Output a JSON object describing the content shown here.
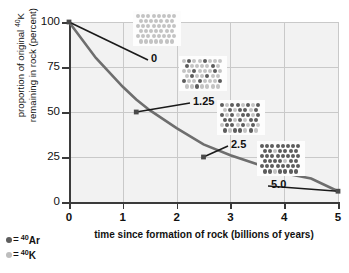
{
  "chart_data": {
    "type": "line",
    "title": "",
    "xlabel": "time since formation of rock (billions of years)",
    "ylabel_line1": "proportion of original ",
    "ylabel_sup1": "40",
    "ylabel_mid": "K",
    "ylabel_line2": "remaining in rock (percent)",
    "ylabel_full": "proportion of original 40K remaining in rock (percent)",
    "xlim": [
      0,
      5
    ],
    "ylim": [
      0,
      100
    ],
    "xticks": [
      "0",
      "1",
      "2",
      "3",
      "4",
      "5"
    ],
    "yticks": [
      "0",
      "25",
      "50",
      "75",
      "100"
    ],
    "grid": true,
    "legend_position": "bottom-left",
    "series": [
      {
        "name": "40K remaining",
        "x": [
          0,
          0.5,
          1.0,
          1.25,
          1.5,
          2.0,
          2.5,
          3.0,
          3.5,
          4.0,
          4.5,
          5.0
        ],
        "values": [
          100,
          80,
          64,
          57,
          51,
          41,
          32,
          26,
          21,
          16,
          13,
          6
        ]
      }
    ],
    "markers": [
      {
        "x": 0,
        "y": 100,
        "label": "0"
      },
      {
        "x": 1.25,
        "y": 50,
        "label": "1.25"
      },
      {
        "x": 2.5,
        "y": 25,
        "label": "2.5"
      },
      {
        "x": 5.0,
        "y": 6,
        "label": "5.0"
      }
    ]
  },
  "legend": {
    "items": [
      {
        "symbol_color": "#5d5d5d",
        "equals": "=",
        "sup": "40",
        "element": "Ar",
        "label": "40Ar"
      },
      {
        "symbol_color": "#bdbdbd",
        "equals": "=",
        "sup": "40",
        "element": "K",
        "label": "40K"
      }
    ]
  },
  "atom_grids": [
    {
      "caption": "0",
      "time": 0,
      "percent_k_remaining": 100,
      "total_atoms": 48,
      "ar_count": 0,
      "k_count": 48,
      "rows": [
        [
          "k",
          "k",
          "k",
          "k",
          "k",
          "k",
          "k",
          "k"
        ],
        [
          "k",
          "k",
          "k",
          "k",
          "k",
          "k",
          "k"
        ],
        [
          "k",
          "k",
          "k",
          "k",
          "k",
          "k",
          "k",
          "k"
        ],
        [
          "k",
          "k",
          "k",
          "k",
          "k",
          "k",
          "k"
        ],
        [
          "k",
          "k",
          "k",
          "k",
          "k",
          "k",
          "k",
          "k"
        ],
        [
          "k",
          "k",
          "k",
          "k",
          "k",
          "k",
          "k"
        ]
      ]
    },
    {
      "caption": "1.25",
      "time": 1.25,
      "percent_k_remaining": 75,
      "total_atoms": 48,
      "ar_count": 12,
      "k_count": 36,
      "rows": [
        [
          "k",
          "ar",
          "k",
          "k",
          "ar",
          "k",
          "k",
          "k"
        ],
        [
          "ar",
          "k",
          "k",
          "k",
          "k",
          "ar",
          "k"
        ],
        [
          "k",
          "k",
          "ar",
          "k",
          "k",
          "k",
          "ar",
          "k"
        ],
        [
          "k",
          "ar",
          "k",
          "k",
          "ar",
          "k",
          "k"
        ],
        [
          "ar",
          "k",
          "k",
          "ar",
          "k",
          "k",
          "k",
          "ar"
        ],
        [
          "k",
          "k",
          "ar",
          "k",
          "k",
          "k",
          "k"
        ]
      ]
    },
    {
      "caption": "2.5",
      "time": 2.5,
      "percent_k_remaining": 50,
      "total_atoms": 48,
      "ar_count": 24,
      "k_count": 24,
      "rows": [
        [
          "ar",
          "k",
          "ar",
          "ar",
          "k",
          "ar",
          "k",
          "ar"
        ],
        [
          "k",
          "ar",
          "k",
          "ar",
          "ar",
          "k",
          "ar"
        ],
        [
          "ar",
          "k",
          "ar",
          "k",
          "ar",
          "ar",
          "k",
          "ar"
        ],
        [
          "ar",
          "ar",
          "k",
          "ar",
          "k",
          "ar",
          "ar"
        ],
        [
          "k",
          "ar",
          "ar",
          "k",
          "ar",
          "k",
          "ar",
          "k"
        ],
        [
          "ar",
          "k",
          "ar",
          "ar",
          "k",
          "ar",
          "k"
        ]
      ]
    },
    {
      "caption": "5.0",
      "time": 5.0,
      "percent_k_remaining": 6,
      "total_atoms": 48,
      "ar_count": 45,
      "k_count": 3,
      "rows": [
        [
          "ar",
          "ar",
          "ar",
          "ar",
          "ar",
          "ar",
          "ar",
          "ar"
        ],
        [
          "ar",
          "ar",
          "k",
          "ar",
          "ar",
          "ar",
          "ar"
        ],
        [
          "ar",
          "ar",
          "ar",
          "ar",
          "ar",
          "ar",
          "ar",
          "ar"
        ],
        [
          "ar",
          "ar",
          "ar",
          "ar",
          "k",
          "ar",
          "ar"
        ],
        [
          "ar",
          "ar",
          "ar",
          "ar",
          "ar",
          "ar",
          "ar",
          "ar"
        ],
        [
          "ar",
          "ar",
          "k",
          "ar",
          "ar",
          "ar",
          "ar"
        ]
      ]
    }
  ],
  "colors": {
    "curve": "#6e6e6e",
    "leader": "#1a1a1a",
    "axis": "#3b3b3b",
    "grid": "#c9c9c9",
    "plot_bg": "#f2f2f2",
    "atom_k": "#c3c3c3",
    "atom_ar": "#5d5d5d"
  }
}
